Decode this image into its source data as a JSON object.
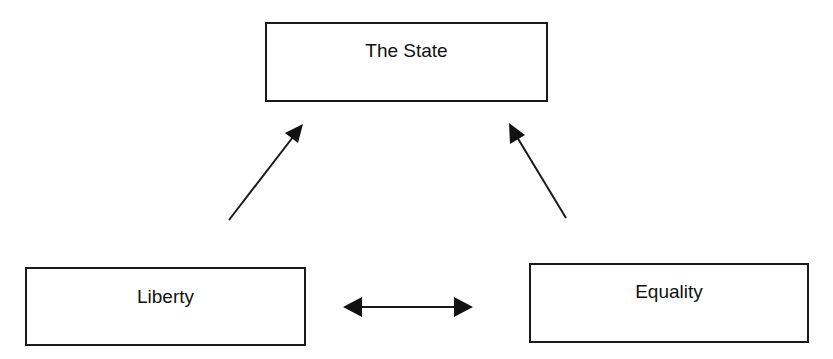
{
  "diagram": {
    "nodes": [
      {
        "id": "state",
        "label": "The State"
      },
      {
        "id": "liberty",
        "label": "Liberty"
      },
      {
        "id": "equality",
        "label": "Equality"
      }
    ],
    "edges": [
      {
        "from": "liberty",
        "to": "state",
        "type": "directed"
      },
      {
        "from": "equality",
        "to": "state",
        "type": "directed"
      },
      {
        "from": "liberty",
        "to": "equality",
        "type": "bidirectional"
      }
    ],
    "colors": {
      "stroke": "#1a1a1a",
      "background": "#ffffff"
    }
  }
}
